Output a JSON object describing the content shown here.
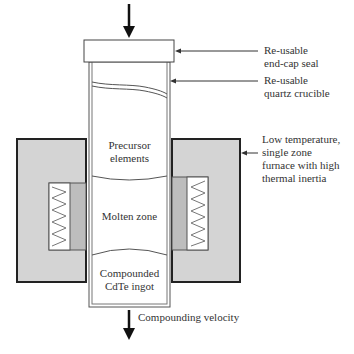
{
  "diagram": {
    "title": "",
    "colors": {
      "furnace_fill": "#d4d4d4",
      "heater_fill": "#bdbdbd",
      "stroke": "#222222",
      "crucible_stroke": "#555555",
      "background": "#ffffff"
    },
    "labels": {
      "end_cap": "Re-usable\nend-cap seal",
      "crucible": "Re-usable\nquartz crucible",
      "furnace": "Low temperature,\nsingle zone\nfurnace with high\nthermal inertia",
      "compounding_velocity": "Compounding velocity"
    },
    "zones": {
      "precursor": "Precursor\nelements",
      "molten": "Molten zone",
      "compounded": "Compounded\nCdTe ingot"
    },
    "arrows": {
      "top_arrow": "downward-pressure-arrow",
      "bottom_arrow": "downward-velocity-arrow"
    }
  }
}
